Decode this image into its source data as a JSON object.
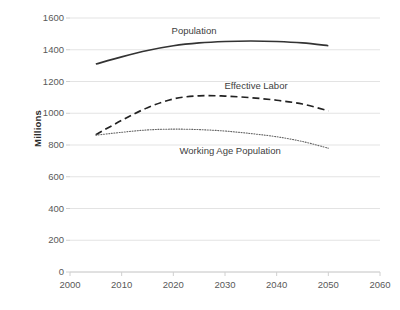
{
  "chart_data": {
    "type": "line",
    "title": "",
    "xlabel": "",
    "ylabel": "Millions",
    "xlim": [
      2000,
      2060
    ],
    "ylim": [
      0,
      1600
    ],
    "xticks": [
      2000,
      2010,
      2020,
      2030,
      2040,
      2050,
      2060
    ],
    "yticks": [
      0,
      200,
      400,
      600,
      800,
      1000,
      1200,
      1400,
      1600
    ],
    "grid": "horizontal",
    "legend": "inline-annotations",
    "x": [
      2005,
      2010,
      2015,
      2020,
      2025,
      2030,
      2035,
      2040,
      2045,
      2050
    ],
    "series": [
      {
        "name": "Population",
        "style": "solid",
        "color": "#333333",
        "values": [
          1310,
          1355,
          1395,
          1425,
          1443,
          1452,
          1455,
          1452,
          1443,
          1425
        ]
      },
      {
        "name": "Effective Labor",
        "style": "dashed",
        "color": "#222222",
        "values": [
          865,
          955,
          1035,
          1090,
          1110,
          1108,
          1098,
          1082,
          1058,
          1015
        ]
      },
      {
        "name": "Working Age Population",
        "style": "dotted",
        "color": "#666666",
        "values": [
          862,
          880,
          895,
          900,
          897,
          888,
          872,
          852,
          822,
          780
        ]
      }
    ],
    "annotations": [
      {
        "text": "Population",
        "x": 2024,
        "y": 1520
      },
      {
        "text": "Effective Labor",
        "x": 2036,
        "y": 1170
      },
      {
        "text": "Working Age Population",
        "x": 2031,
        "y": 760
      }
    ]
  },
  "axis": {
    "y_title": "Millions",
    "y_tick_labels": [
      "1600",
      "1400",
      "1200",
      "1000",
      "800",
      "600",
      "400",
      "200",
      "0"
    ],
    "x_tick_labels": [
      "2000",
      "2010",
      "2020",
      "2030",
      "2040",
      "2050",
      "2060"
    ]
  },
  "colors": {
    "grid": "#e3e3e3",
    "axis": "#d0d0d0",
    "population": "#333333",
    "effective_labor": "#222222",
    "working_age": "#666666",
    "tick_text": "#595959",
    "title_text": "#2c2c2c"
  }
}
